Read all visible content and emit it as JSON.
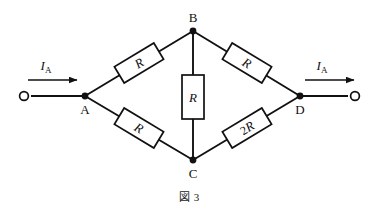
{
  "figure": {
    "caption": "図 3",
    "caption_label": "図",
    "caption_number": "3"
  },
  "nodes": [
    {
      "id": "A",
      "label": "A",
      "x": 85,
      "y": 96,
      "label_x": 85,
      "label_y": 112
    },
    {
      "id": "B",
      "label": "B",
      "x": 193,
      "y": 31,
      "label_x": 193,
      "label_y": 22
    },
    {
      "id": "C",
      "label": "C",
      "x": 193,
      "y": 160,
      "label_x": 193,
      "label_y": 176
    },
    {
      "id": "D",
      "label": "D",
      "x": 300,
      "y": 96,
      "label_x": 300,
      "label_y": 112
    }
  ],
  "terminals": [
    {
      "id": "left-terminal",
      "x": 24,
      "y": 96
    },
    {
      "id": "right-terminal",
      "x": 355,
      "y": 96
    }
  ],
  "currents": [
    {
      "id": "input-current",
      "symbol": "I",
      "subscript": "A",
      "text": "I_A",
      "label_x": 46,
      "label_y": 70,
      "arrow_x1": 28,
      "arrow_x2": 77,
      "arrow_y": 80
    },
    {
      "id": "output-current",
      "symbol": "I",
      "subscript": "A",
      "text": "I_A",
      "label_x": 322,
      "label_y": 70,
      "arrow_x1": 305,
      "arrow_x2": 354,
      "arrow_y": 80
    }
  ],
  "resistors": [
    {
      "id": "resistor-ab",
      "branch": "A-B",
      "label": "R",
      "prefix": "",
      "cx": 139,
      "cy": 63,
      "angle": -31,
      "w": 46,
      "h": 19
    },
    {
      "id": "resistor-bd",
      "branch": "B-D",
      "label": "R",
      "prefix": "",
      "cx": 247,
      "cy": 63,
      "angle": 31,
      "w": 46,
      "h": 19
    },
    {
      "id": "resistor-bc",
      "branch": "B-C",
      "label": "R",
      "prefix": "",
      "cx": 193,
      "cy": 97,
      "angle": 0,
      "w": 22,
      "h": 44
    },
    {
      "id": "resistor-ac",
      "branch": "A-C",
      "label": "R",
      "prefix": "",
      "cx": 139,
      "cy": 128,
      "angle": 31,
      "w": 46,
      "h": 19
    },
    {
      "id": "resistor-cd",
      "branch": "C-D",
      "label": "R",
      "prefix": "2",
      "cx": 247,
      "cy": 128,
      "angle": -31,
      "w": 46,
      "h": 19
    }
  ],
  "colors": {
    "ink": "#111111",
    "paper": "#ffffff"
  }
}
